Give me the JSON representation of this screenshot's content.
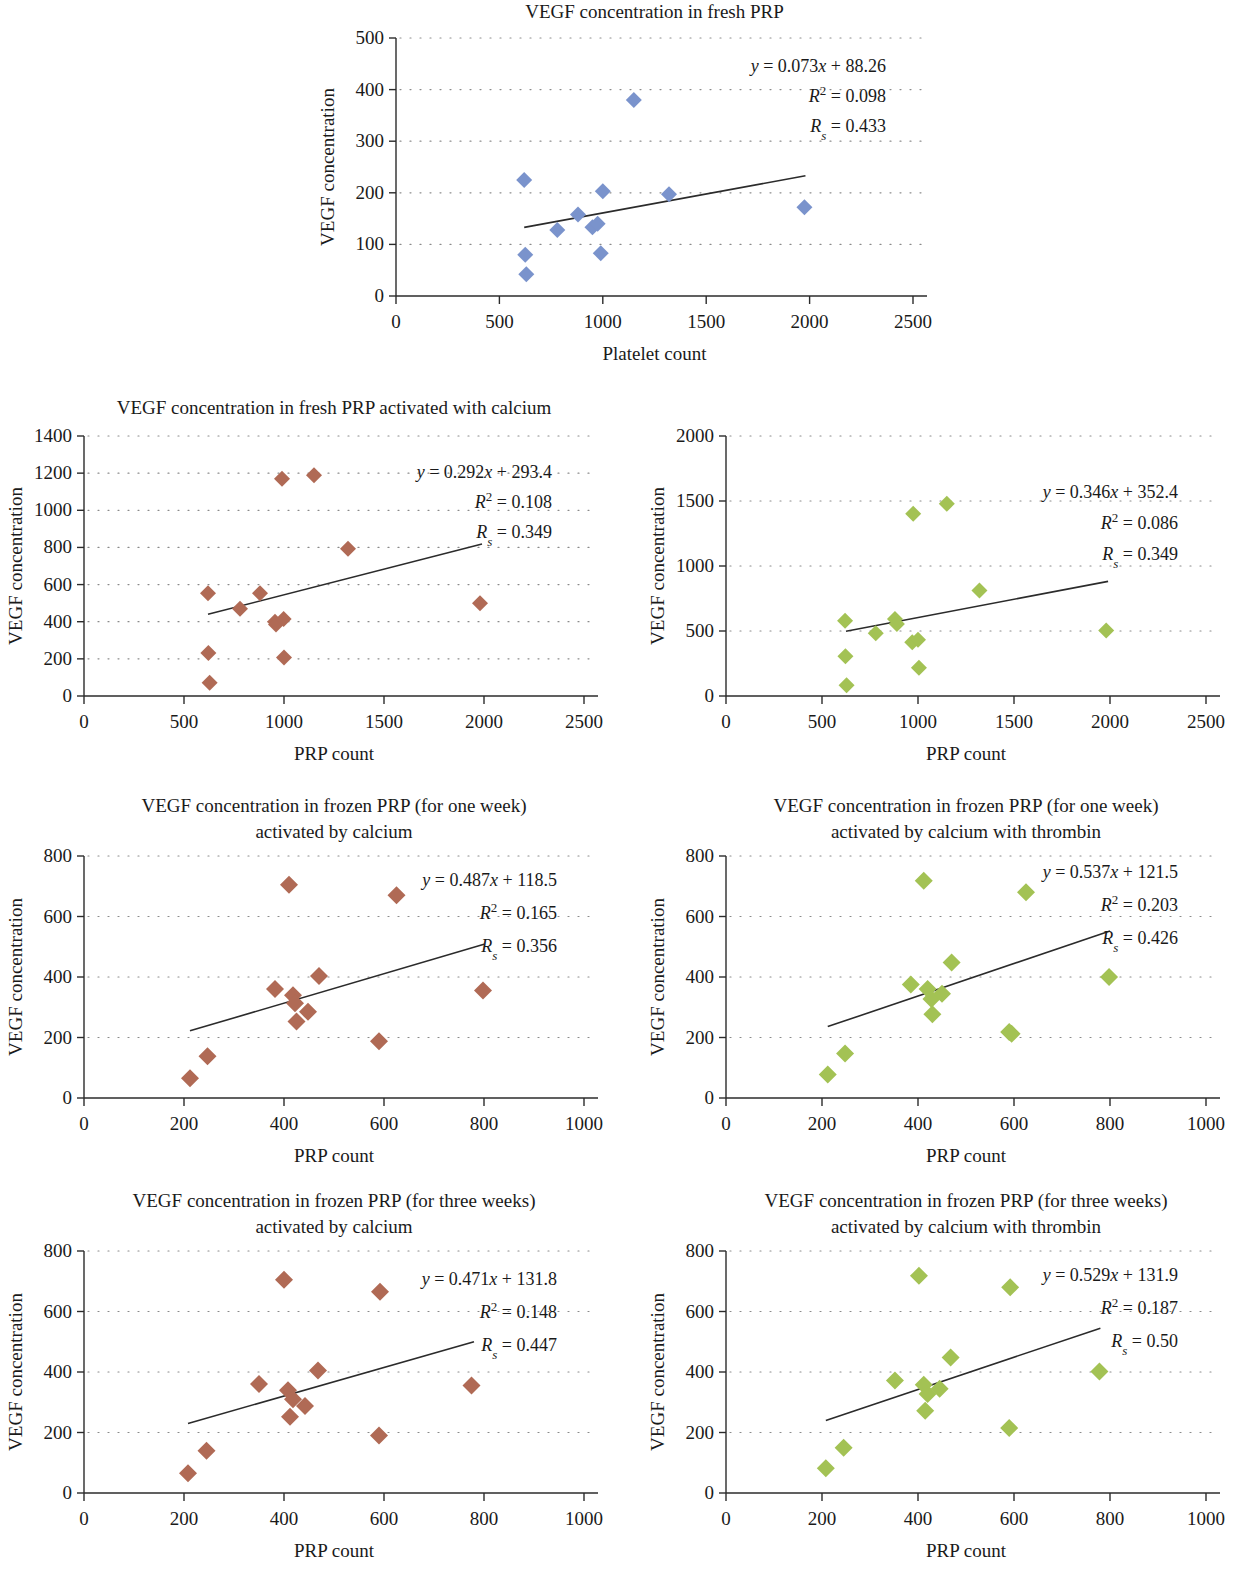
{
  "figure": {
    "common_y_axis_label": "VEGF concentration",
    "common_x_axis_label": "PRP count",
    "colors": {
      "blue": "#7a93cc",
      "red": "#b06a55",
      "green": "#a3c254",
      "axis": "#2b2b2b",
      "grid": "#8a8a8a",
      "background": "#ffffff"
    }
  },
  "chart_data": [
    {
      "id": "fresh-prp",
      "type": "scatter",
      "title": "VEGF concentration in fresh PRP",
      "xlabel": "Platelet count",
      "ylabel": "VEGF concentration",
      "xlim": [
        0,
        2500
      ],
      "ylim": [
        0,
        500
      ],
      "xticks": [
        0,
        500,
        1000,
        1500,
        2000,
        2500
      ],
      "yticks": [
        0,
        100,
        200,
        300,
        400,
        500
      ],
      "grid": true,
      "color": "#7a93cc",
      "equation": "y = 0.073x + 88.26",
      "r2": "R² = 0.098",
      "rs": "Rs = 0.433",
      "eq_slope": "0.073",
      "eq_intercept": "88.26",
      "r2_value": "0.098",
      "rs_value": "0.433",
      "trendline": {
        "x0": 620,
        "x1": 1980,
        "y0": 133,
        "y1": 233
      },
      "points": [
        {
          "x": 620,
          "y": 225
        },
        {
          "x": 625,
          "y": 80
        },
        {
          "x": 630,
          "y": 42
        },
        {
          "x": 780,
          "y": 128
        },
        {
          "x": 880,
          "y": 158
        },
        {
          "x": 950,
          "y": 133
        },
        {
          "x": 975,
          "y": 140
        },
        {
          "x": 990,
          "y": 83
        },
        {
          "x": 1000,
          "y": 203
        },
        {
          "x": 1150,
          "y": 380
        },
        {
          "x": 1320,
          "y": 197
        },
        {
          "x": 1975,
          "y": 172
        }
      ]
    },
    {
      "id": "fresh-calcium",
      "type": "scatter",
      "title": "VEGF concentration in fresh PRP activated with calcium",
      "xlabel": "PRP count",
      "ylabel": "VEGF concentration",
      "xlim": [
        0,
        2500
      ],
      "ylim": [
        0,
        1400
      ],
      "xticks": [
        0,
        500,
        1000,
        1500,
        2000,
        2500
      ],
      "yticks": [
        0,
        200,
        400,
        600,
        800,
        1000,
        1200,
        1400
      ],
      "grid": true,
      "color": "#b06a55",
      "equation": "y = 0.292x + 293.4",
      "r2": "R² = 0.108",
      "rs": "Rs = 0.349",
      "eq_slope": "0.292",
      "eq_intercept": "293.4",
      "r2_value": "0.108",
      "rs_value": "0.349",
      "trendline": {
        "x0": 620,
        "x1": 1990,
        "y0": 440,
        "y1": 818
      },
      "points": [
        {
          "x": 620,
          "y": 553
        },
        {
          "x": 622,
          "y": 232
        },
        {
          "x": 628,
          "y": 72
        },
        {
          "x": 780,
          "y": 470
        },
        {
          "x": 880,
          "y": 553
        },
        {
          "x": 955,
          "y": 400
        },
        {
          "x": 960,
          "y": 385
        },
        {
          "x": 990,
          "y": 1170
        },
        {
          "x": 998,
          "y": 415
        },
        {
          "x": 1000,
          "y": 207
        },
        {
          "x": 1150,
          "y": 1188
        },
        {
          "x": 1320,
          "y": 793
        },
        {
          "x": 1980,
          "y": 500
        }
      ]
    },
    {
      "id": "fresh-calcium-thrombin",
      "type": "scatter",
      "title": "VEGF concentration in fresh PRP activated by calcium with thrombin",
      "xlabel": "PRP count",
      "ylabel": "VEGF concentration",
      "xlim": [
        0,
        2500
      ],
      "ylim": [
        0,
        2000
      ],
      "xticks": [
        0,
        500,
        1000,
        1500,
        2000,
        2500
      ],
      "yticks": [
        0,
        500,
        1000,
        1500,
        2000
      ],
      "grid": true,
      "color": "#a3c254",
      "equation": "y = 0.346x + 352.4",
      "r2": "R² = 0.086",
      "rs": "Rs = 0.349",
      "eq_slope": "0.346",
      "eq_intercept": "352.4",
      "r2_value": "0.086",
      "rs_value": "0.349",
      "trendline": {
        "x0": 625,
        "x1": 1990,
        "y0": 498,
        "y1": 882
      },
      "points": [
        {
          "x": 620,
          "y": 578
        },
        {
          "x": 622,
          "y": 305
        },
        {
          "x": 628,
          "y": 82
        },
        {
          "x": 780,
          "y": 483
        },
        {
          "x": 880,
          "y": 592
        },
        {
          "x": 890,
          "y": 553
        },
        {
          "x": 970,
          "y": 413
        },
        {
          "x": 975,
          "y": 1402
        },
        {
          "x": 1000,
          "y": 433
        },
        {
          "x": 1005,
          "y": 218
        },
        {
          "x": 1150,
          "y": 1478
        },
        {
          "x": 1320,
          "y": 812
        },
        {
          "x": 1980,
          "y": 503
        }
      ]
    },
    {
      "id": "frozen-one-week-calcium",
      "type": "scatter",
      "title": "VEGF concentration in frozen PRP (for one week) activated by calcium",
      "title_line1": "VEGF concentration in frozen PRP (for one week)",
      "title_line2": "activated by calcium",
      "xlabel": "PRP count",
      "ylabel": "VEGF concentration",
      "xlim": [
        0,
        1000
      ],
      "ylim": [
        0,
        800
      ],
      "xticks": [
        0,
        200,
        400,
        600,
        800,
        1000
      ],
      "yticks": [
        0,
        200,
        400,
        600,
        800
      ],
      "grid": true,
      "color": "#b06a55",
      "equation": "y = 0.487x + 118.5",
      "r2": "R² = 0.165",
      "rs": "Rs = 0.356",
      "eq_slope": "0.487",
      "eq_intercept": "118.5",
      "r2_value": "0.165",
      "rs_value": "0.356",
      "trendline": {
        "x0": 212,
        "x1": 800,
        "y0": 222,
        "y1": 508
      },
      "points": [
        {
          "x": 212,
          "y": 65
        },
        {
          "x": 247,
          "y": 138
        },
        {
          "x": 382,
          "y": 360
        },
        {
          "x": 410,
          "y": 705
        },
        {
          "x": 418,
          "y": 340
        },
        {
          "x": 422,
          "y": 313
        },
        {
          "x": 425,
          "y": 253
        },
        {
          "x": 448,
          "y": 285
        },
        {
          "x": 470,
          "y": 403
        },
        {
          "x": 590,
          "y": 188
        },
        {
          "x": 625,
          "y": 670
        },
        {
          "x": 798,
          "y": 355
        }
      ]
    },
    {
      "id": "frozen-one-week-calcium-thrombin",
      "type": "scatter",
      "title": "VEGF concentration in frozen PRP (for one week) activated by calcium with thrombin",
      "title_line1": "VEGF concentration in frozen PRP (for one week)",
      "title_line2": "activated by calcium with thrombin",
      "xlabel": "PRP count",
      "ylabel": "VEGF concentration",
      "xlim": [
        0,
        1000
      ],
      "ylim": [
        0,
        800
      ],
      "xticks": [
        0,
        200,
        400,
        600,
        800,
        1000
      ],
      "yticks": [
        0,
        200,
        400,
        600,
        800
      ],
      "grid": true,
      "color": "#a3c254",
      "equation": "y = 0.537x + 121.5",
      "r2": "R² = 0.203",
      "rs": "Rs = 0.426",
      "eq_slope": "0.537",
      "eq_intercept": "121.5",
      "r2_value": "0.203",
      "rs_value": "0.426",
      "trendline": {
        "x0": 212,
        "x1": 800,
        "y0": 236,
        "y1": 552
      },
      "points": [
        {
          "x": 212,
          "y": 78
        },
        {
          "x": 248,
          "y": 147
        },
        {
          "x": 385,
          "y": 375
        },
        {
          "x": 412,
          "y": 718
        },
        {
          "x": 420,
          "y": 360
        },
        {
          "x": 428,
          "y": 327
        },
        {
          "x": 430,
          "y": 277
        },
        {
          "x": 450,
          "y": 345
        },
        {
          "x": 470,
          "y": 448
        },
        {
          "x": 590,
          "y": 218
        },
        {
          "x": 595,
          "y": 212
        },
        {
          "x": 625,
          "y": 680
        },
        {
          "x": 798,
          "y": 400
        }
      ]
    },
    {
      "id": "frozen-three-weeks-calcium",
      "type": "scatter",
      "title": "VEGF concentration in frozen PRP (for three weeks) activated by calcium",
      "title_line1": "VEGF concentration in frozen PRP (for three weeks)",
      "title_line2": "activated by calcium",
      "xlabel": "PRP count",
      "ylabel": "VEGF concentration",
      "xlim": [
        0,
        1000
      ],
      "ylim": [
        0,
        800
      ],
      "xticks": [
        0,
        200,
        400,
        600,
        800,
        1000
      ],
      "yticks": [
        0,
        200,
        400,
        600,
        800
      ],
      "grid": true,
      "color": "#b06a55",
      "equation": "y = 0.471x + 131.8",
      "r2": "R² = 0.148",
      "rs": "Rs = 0.447",
      "eq_slope": "0.471",
      "eq_intercept": "131.8",
      "r2_value": "0.148",
      "rs_value": "0.447",
      "trendline": {
        "x0": 208,
        "x1": 780,
        "y0": 230,
        "y1": 500
      },
      "points": [
        {
          "x": 208,
          "y": 65
        },
        {
          "x": 245,
          "y": 140
        },
        {
          "x": 350,
          "y": 360
        },
        {
          "x": 400,
          "y": 705
        },
        {
          "x": 408,
          "y": 340
        },
        {
          "x": 418,
          "y": 310
        },
        {
          "x": 412,
          "y": 252
        },
        {
          "x": 442,
          "y": 288
        },
        {
          "x": 468,
          "y": 405
        },
        {
          "x": 590,
          "y": 190
        },
        {
          "x": 592,
          "y": 665
        },
        {
          "x": 775,
          "y": 355
        }
      ]
    },
    {
      "id": "frozen-three-weeks-calcium-thrombin",
      "type": "scatter",
      "title": "VEGF concentration in frozen PRP (for three weeks) activated by calcium with thrombin",
      "title_line1": "VEGF concentration in frozen PRP (for three weeks)",
      "title_line2": "activated by calcium with thrombin",
      "xlabel": "PRP count",
      "ylabel": "VEGF concentration",
      "xlim": [
        0,
        1000
      ],
      "ylim": [
        0,
        800
      ],
      "xticks": [
        0,
        200,
        400,
        600,
        800,
        1000
      ],
      "yticks": [
        0,
        200,
        400,
        600,
        800
      ],
      "grid": true,
      "color": "#a3c254",
      "equation": "y = 0.529x + 131.9",
      "r2": "R² = 0.187",
      "rs": "Rs = 0.50",
      "eq_slope": "0.529",
      "eq_intercept": "131.9",
      "r2_value": "0.187",
      "rs_value": "0.50",
      "trendline": {
        "x0": 208,
        "x1": 780,
        "y0": 240,
        "y1": 545
      },
      "points": [
        {
          "x": 208,
          "y": 82
        },
        {
          "x": 245,
          "y": 150
        },
        {
          "x": 352,
          "y": 372
        },
        {
          "x": 402,
          "y": 718
        },
        {
          "x": 412,
          "y": 358
        },
        {
          "x": 420,
          "y": 327
        },
        {
          "x": 415,
          "y": 272
        },
        {
          "x": 445,
          "y": 345
        },
        {
          "x": 468,
          "y": 448
        },
        {
          "x": 590,
          "y": 215
        },
        {
          "x": 592,
          "y": 680
        },
        {
          "x": 778,
          "y": 402
        }
      ]
    }
  ]
}
